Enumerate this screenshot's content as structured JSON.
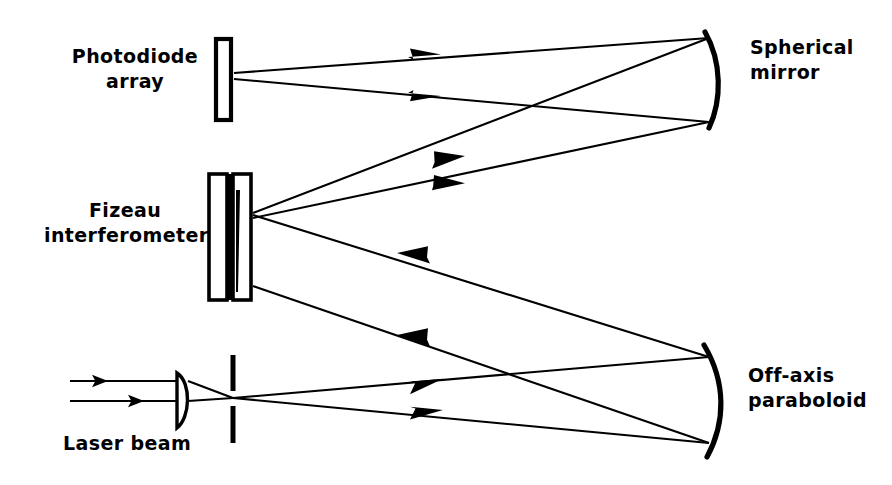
{
  "figure": {
    "kind": "optical-ray-diagram",
    "background_color": "#ffffff",
    "ink_color": "#000000",
    "width": 892,
    "height": 485
  },
  "labels": {
    "photodiode_array": "Photodiode\narray",
    "fizeau_interferometer": "Fizeau\ninterferometer",
    "laser_beam": "Laser beam",
    "spherical_mirror": "Spherical\nmirror",
    "off_axis_paraboloid": "Off-axis\nparaboloid"
  },
  "label_lines": {
    "photodiode_array": [
      "Photodiode",
      "array"
    ],
    "fizeau_interferometer": [
      "Fizeau",
      "interferometer"
    ],
    "laser_beam": [
      "Laser beam"
    ],
    "spherical_mirror": [
      "Spherical",
      "mirror"
    ],
    "off_axis_paraboloid": [
      "Off-axis",
      "paraboloid"
    ]
  },
  "components": [
    {
      "name": "photodiode-array",
      "type": "detector",
      "shape": "hollow-rectangle",
      "x": 215,
      "y": 38,
      "width": 16,
      "height": 82
    },
    {
      "name": "fizeau-interferometer",
      "type": "interferometer",
      "shape": "two-parallel-plates",
      "x": 208,
      "y": 173,
      "width": 44,
      "height": 128
    },
    {
      "name": "collimating-lens",
      "type": "plano-convex-lens",
      "x": 175,
      "y": 372,
      "width": 14,
      "height": 54
    },
    {
      "name": "pinhole-aperture",
      "type": "spatial-filter",
      "x": 231,
      "y": 355,
      "gap_top": 392,
      "gap_bottom": 406,
      "height": 88
    },
    {
      "name": "spherical-mirror",
      "type": "concave-mirror",
      "shape": "arc",
      "top_y": 35,
      "bottom_y": 126,
      "x": 707
    },
    {
      "name": "off-axis-paraboloid",
      "type": "concave-mirror",
      "shape": "arc",
      "top_y": 345,
      "bottom_y": 455,
      "x": 707
    }
  ],
  "rays": {
    "count": 10,
    "arrow_color": "#000000",
    "description": "Laser beam expands through lens and pinhole, travels to off-axis paraboloid, reflects to Fizeau interferometer, then to spherical mirror, then to photodiode array."
  }
}
